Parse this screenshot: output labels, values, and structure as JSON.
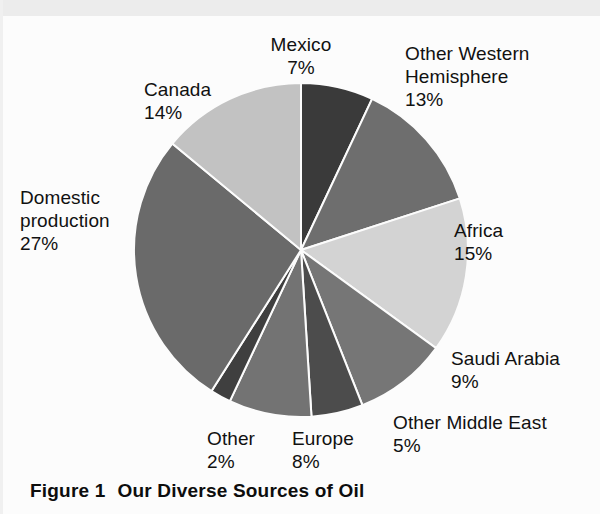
{
  "figure": {
    "caption_label": "Figure 1",
    "caption_title": "Our Diverse Sources of Oil",
    "background_color": "#fcfcfc"
  },
  "chart_data": {
    "type": "pie",
    "title": "Our Diverse Sources of Oil",
    "xlabel": "",
    "ylabel": "",
    "units": "percent",
    "total": 100,
    "start_angle_deg": 0,
    "direction": "clockwise",
    "legend": "none (direct labels)",
    "grid": false,
    "categories": [
      "Mexico",
      "Other Western Hemisphere",
      "Africa",
      "Saudi Arabia",
      "Other Middle East",
      "Europe",
      "Other",
      "Domestic production",
      "Canada"
    ],
    "values": [
      7,
      13,
      15,
      9,
      5,
      8,
      2,
      27,
      14
    ],
    "colors": [
      "#3a3a3a",
      "#6e6e6e",
      "#d3d3d3",
      "#767676",
      "#4c4c4c",
      "#737373",
      "#3f3f3f",
      "#6a6a6a",
      "#c2c2c2"
    ],
    "slices": [
      {
        "label": "Mexico",
        "value": 7,
        "percent_text": "7%",
        "color": "#3a3a3a"
      },
      {
        "label": "Other Western Hemisphere",
        "value": 13,
        "percent_text": "13%",
        "color": "#6e6e6e"
      },
      {
        "label": "Africa",
        "value": 15,
        "percent_text": "15%",
        "color": "#d3d3d3"
      },
      {
        "label": "Saudi Arabia",
        "value": 9,
        "percent_text": "9%",
        "color": "#767676"
      },
      {
        "label": "Other Middle East",
        "value": 5,
        "percent_text": "5%",
        "color": "#4c4c4c"
      },
      {
        "label": "Europe",
        "value": 8,
        "percent_text": "8%",
        "color": "#737373"
      },
      {
        "label": "Other",
        "value": 2,
        "percent_text": "2%",
        "color": "#3f3f3f"
      },
      {
        "label": "Domestic production",
        "value": 27,
        "percent_text": "27%",
        "color": "#6a6a6a"
      },
      {
        "label": "Canada",
        "value": 14,
        "percent_text": "14%",
        "color": "#c2c2c2"
      }
    ]
  },
  "labels": {
    "canada": "Canada\n14%",
    "mexico": "Mexico\n7%",
    "other_western_hemisphere": "Other Western\nHemisphere\n13%",
    "africa": "Africa\n15%",
    "saudi_arabia": "Saudi Arabia\n9%",
    "other_middle_east": "Other Middle East\n5%",
    "europe": "Europe\n8%",
    "other": "Other\n2%",
    "domestic_production": "Domestic\nproduction\n27%"
  },
  "geometry": {
    "center_x": 301,
    "center_y": 250,
    "radius": 167
  }
}
